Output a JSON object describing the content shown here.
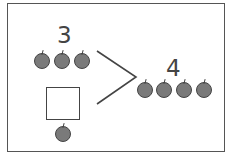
{
  "diagram": {
    "type": "number-composition",
    "part_top": {
      "value": "3",
      "apples": 3
    },
    "part_bottom": {
      "value": "",
      "apples": 1,
      "answer_box": "empty"
    },
    "whole": {
      "value": "4",
      "apples": 4
    },
    "colors": {
      "apple": "#7a7a7a",
      "outline": "#444444",
      "background": "#ffffff"
    }
  }
}
